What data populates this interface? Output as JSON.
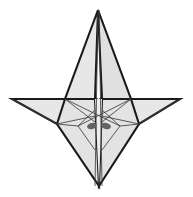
{
  "figure": {
    "width": 193,
    "height": 197,
    "background_color": "#ffffff",
    "face_fill_light": "#e7e7e7",
    "face_fill_mid": "#dedede",
    "face_fill_pale": "#efefef",
    "outline_color": "#1a1a1a",
    "crease_color": "#3d3d3d",
    "marker_color": "#5a5a5a",
    "outline_width": 2.1,
    "crease_width": 0.85,
    "points": {
      "apex_top": [
        98,
        10
      ],
      "wing_tip_left": [
        12,
        99
      ],
      "wing_tip_right": [
        180,
        99
      ],
      "bottom_tip": [
        99,
        186
      ],
      "shoulder_left": [
        65,
        99
      ],
      "shoulder_right": [
        131,
        99
      ],
      "body_left": [
        57,
        124
      ],
      "body_right": [
        139,
        124
      ],
      "fold_left": [
        78,
        126
      ],
      "fold_right": [
        120,
        126
      ],
      "spine_left": [
        95,
        99
      ],
      "spine_right": [
        102,
        99
      ],
      "center_waist": [
        98,
        122
      ]
    },
    "shapes": [
      {
        "name": "upper-left-face",
        "kind": "polygon",
        "fill": "#e7e7e7",
        "stroke": "#1a1a1a",
        "stroke_width": 2.1,
        "points": "98,10 95,99 65,99"
      },
      {
        "name": "upper-right-face",
        "kind": "polygon",
        "fill": "#e0e0e0",
        "stroke": "#1a1a1a",
        "stroke_width": 2.1,
        "points": "98,10 131,99 102,99"
      },
      {
        "name": "left-wing-face",
        "kind": "polygon",
        "fill": "#e7e7e7",
        "stroke": "#1a1a1a",
        "stroke_width": 2.1,
        "points": "12,99 65,99 95,99 57,124"
      },
      {
        "name": "right-wing-face",
        "kind": "polygon",
        "fill": "#e7e7e7",
        "stroke": "#1a1a1a",
        "stroke_width": 2.1,
        "points": "180,99 131,99 102,99 139,124"
      },
      {
        "name": "lower-left-face",
        "kind": "polygon",
        "fill": "#e3e3e3",
        "stroke": "#1a1a1a",
        "stroke_width": 2.1,
        "points": "65,99 95,99 99,186 57,124"
      },
      {
        "name": "lower-right-face",
        "kind": "polygon",
        "fill": "#e3e3e3",
        "stroke": "#1a1a1a",
        "stroke_width": 2.1,
        "points": "131,99 102,99 99,186 139,124"
      },
      {
        "name": "lower-center-face",
        "kind": "polygon",
        "fill": "#ededed",
        "stroke": "none",
        "stroke_width": 0,
        "points": "95,99 102,99 99,186"
      }
    ],
    "creases": [
      {
        "name": "crease-spine-left",
        "x1": 98,
        "y1": 10,
        "x2": 95,
        "y2": 186
      },
      {
        "name": "crease-spine-right",
        "x1": 99,
        "y1": 10,
        "x2": 102,
        "y2": 186
      },
      {
        "name": "crease-left-upper-diagonal",
        "x1": 65,
        "y1": 99,
        "x2": 120,
        "y2": 126
      },
      {
        "name": "crease-right-upper-diagonal",
        "x1": 131,
        "y1": 99,
        "x2": 78,
        "y2": 126
      },
      {
        "name": "crease-left-inner-fan",
        "x1": 65,
        "y1": 99,
        "x2": 95,
        "y2": 122
      },
      {
        "name": "crease-right-inner-fan",
        "x1": 131,
        "y1": 99,
        "x2": 102,
        "y2": 122
      },
      {
        "name": "crease-left-outer-fan",
        "x1": 57,
        "y1": 124,
        "x2": 95,
        "y2": 116
      },
      {
        "name": "crease-right-outer-fan",
        "x1": 139,
        "y1": 124,
        "x2": 102,
        "y2": 116
      },
      {
        "name": "crease-left-petal",
        "x1": 78,
        "y1": 126,
        "x2": 95,
        "y2": 110
      },
      {
        "name": "crease-right-petal",
        "x1": 120,
        "y1": 126,
        "x2": 102,
        "y2": 110
      },
      {
        "name": "crease-left-edge-short",
        "x1": 57,
        "y1": 124,
        "x2": 78,
        "y2": 126
      },
      {
        "name": "crease-right-edge-short",
        "x1": 139,
        "y1": 124,
        "x2": 120,
        "y2": 126
      },
      {
        "name": "crease-left-valley",
        "x1": 78,
        "y1": 126,
        "x2": 95,
        "y2": 150
      },
      {
        "name": "crease-right-valley",
        "x1": 120,
        "y1": 126,
        "x2": 102,
        "y2": 150
      },
      {
        "name": "crease-wing-left-seam",
        "x1": 12,
        "y1": 99,
        "x2": 57,
        "y2": 124
      },
      {
        "name": "crease-wing-right-seam",
        "x1": 180,
        "y1": 99,
        "x2": 139,
        "y2": 124
      }
    ],
    "markers": [
      {
        "name": "fold-marker-left",
        "cx": 92,
        "cy": 126,
        "rx": 5.0,
        "ry": 3.2,
        "rotate": -14,
        "fill": "#636363"
      },
      {
        "name": "fold-marker-right",
        "cx": 106,
        "cy": 126,
        "rx": 5.0,
        "ry": 3.2,
        "rotate": 14,
        "fill": "#636363"
      }
    ]
  }
}
